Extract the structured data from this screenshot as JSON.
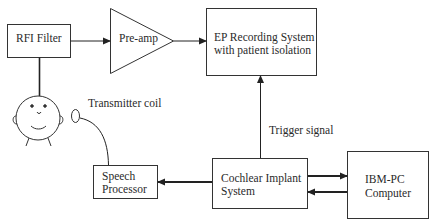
{
  "diagram": {
    "nodes": {
      "rfi_filter": {
        "label": "RFI Filter"
      },
      "preamp": {
        "label": "Pre-amp"
      },
      "ep_recording": {
        "line1": "EP Recording System",
        "line2": "with patient isolation"
      },
      "speech_processor": {
        "line1": "Speech",
        "line2": "Processor"
      },
      "cochlear_implant": {
        "line1": "Cochlear Implant",
        "line2": "System"
      },
      "ibm_pc": {
        "line1": "IBM-PC",
        "line2": "Computer"
      }
    },
    "annotations": {
      "transmitter_coil": "Transmitter coil",
      "trigger_signal": "Trigger signal"
    },
    "edges": [
      {
        "from": "rfi_filter",
        "to": "preamp"
      },
      {
        "from": "preamp",
        "to": "ep_recording"
      },
      {
        "from": "cochlear_implant",
        "to": "ep_recording",
        "label": "Trigger signal"
      },
      {
        "from": "cochlear_implant",
        "to": "speech_processor"
      },
      {
        "from": "cochlear_implant",
        "to": "ibm_pc"
      },
      {
        "from": "ibm_pc",
        "to": "cochlear_implant"
      },
      {
        "from": "speech_processor",
        "to": "transmitter_coil"
      },
      {
        "from": "patient_head",
        "to": "rfi_filter"
      }
    ]
  }
}
